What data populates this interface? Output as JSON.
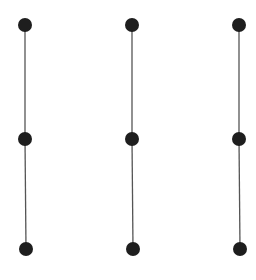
{
  "diagram": {
    "type": "graph",
    "colors": {
      "node": "#1e1e1e",
      "edge": "#555555",
      "background": "#ffffff"
    },
    "node_radius": 7,
    "nodes": [
      {
        "id": "a1",
        "x": 25,
        "y": 25
      },
      {
        "id": "a2",
        "x": 25,
        "y": 139
      },
      {
        "id": "a3",
        "x": 26,
        "y": 249
      },
      {
        "id": "b1",
        "x": 132,
        "y": 25
      },
      {
        "id": "b2",
        "x": 132,
        "y": 139
      },
      {
        "id": "b3",
        "x": 133,
        "y": 249
      },
      {
        "id": "c1",
        "x": 239,
        "y": 25
      },
      {
        "id": "c2",
        "x": 239,
        "y": 139
      },
      {
        "id": "c3",
        "x": 240,
        "y": 249
      }
    ],
    "edges": [
      {
        "from": "a1",
        "to": "a2"
      },
      {
        "from": "a2",
        "to": "a3"
      },
      {
        "from": "b1",
        "to": "b2"
      },
      {
        "from": "b2",
        "to": "b3"
      },
      {
        "from": "c1",
        "to": "c2"
      },
      {
        "from": "c2",
        "to": "c3"
      }
    ]
  }
}
